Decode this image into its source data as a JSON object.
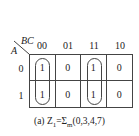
{
  "kmap": {
    "col_var": "BC",
    "row_var": "A",
    "col_headers": [
      "00",
      "01",
      "11",
      "10"
    ],
    "row_headers": [
      "0",
      "1"
    ],
    "cells": [
      [
        "1",
        "0",
        "1",
        "0"
      ],
      [
        "1",
        "0",
        "1",
        "0"
      ]
    ],
    "groups": [
      {
        "columns": "00",
        "rows": "0-1"
      },
      {
        "columns": "11",
        "rows": "0-1"
      }
    ]
  },
  "caption": {
    "prefix": "(a) Z",
    "subscript": "1",
    "equals": "=Σ",
    "sigma_sub": "m",
    "terms": "(0,3,4,7)"
  }
}
